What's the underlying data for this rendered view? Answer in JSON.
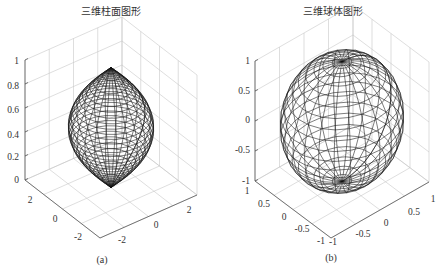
{
  "chart_data": [
    {
      "type": "surface3d",
      "panel_label": "(a)",
      "title": "三维柱面图形",
      "description": "Cylinder surface generated with radius profile r = 2 + sin(t) style hourglass: two cones/bulbs meeting at a narrow waist at z≈0.5",
      "zlim": [
        0,
        1
      ],
      "zticks": [
        "0",
        "0.2",
        "0.4",
        "0.6",
        "0.8",
        "1"
      ],
      "xticks": [
        "-2",
        "0",
        "2"
      ],
      "yticks": [
        "-2",
        "0",
        "2"
      ],
      "grid": true,
      "mesh_color": "#000000"
    },
    {
      "type": "surface3d",
      "panel_label": "(b)",
      "title": "三维球体图形",
      "description": "Unit sphere wireframe mesh",
      "zlim": [
        -1,
        1
      ],
      "zticks": [
        "-1",
        "-0.5",
        "0",
        "0.5",
        "1"
      ],
      "xticks": [
        "-1",
        "-0.5",
        "0",
        "0.5",
        "1"
      ],
      "yticks": [
        "-1",
        "-0.5",
        "0",
        "0.5",
        "1"
      ],
      "grid": true,
      "mesh_color": "#000000"
    }
  ],
  "left": {
    "title": "三维柱面图形",
    "caption": "(a)",
    "zticks": [
      "1",
      "0.8",
      "0.6",
      "0.4",
      "0.2",
      "0"
    ],
    "yticks": [
      "2",
      "0",
      "-2"
    ],
    "xticks": [
      "-2",
      "0",
      "2"
    ]
  },
  "right": {
    "title": "三维球体图形",
    "caption": "(b)",
    "zticks": [
      "1",
      "0.5",
      "0",
      "-0.5",
      "-1"
    ],
    "yticks": [
      "1",
      "0.5",
      "0",
      "-0.5",
      "-1"
    ],
    "xticks": [
      "-1",
      "-0.5",
      "0",
      "0.5",
      "1"
    ]
  }
}
